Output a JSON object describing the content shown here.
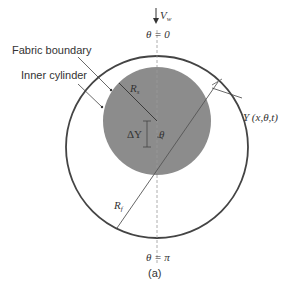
{
  "figure": {
    "caption": "(a)",
    "labels": {
      "velocity": "V",
      "velocity_sub": "w",
      "theta_top": "θ = 0",
      "theta_bottom": "θ = π",
      "fabric_boundary": "Fabric boundary",
      "inner_cylinder": "Inner cylinder",
      "rs": "R",
      "rs_sub": "s",
      "rf": "R",
      "rf_sub": "f",
      "delta_y": "ΔY",
      "theta": "θ",
      "y_func": "Y (x,θ,t)"
    },
    "colors": {
      "inner_fill": "#8c8c8c",
      "outer_stroke": "#444444",
      "line": "#555555",
      "axis_dash": "#999999"
    }
  }
}
